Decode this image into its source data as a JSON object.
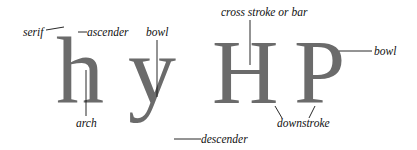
{
  "diagram": {
    "letters": [
      {
        "char": "h",
        "name": "h"
      },
      {
        "char": "y",
        "name": "y"
      },
      {
        "char": "H",
        "name": "H"
      },
      {
        "char": "P",
        "name": "P"
      }
    ],
    "labels": {
      "serif": "serif",
      "ascender": "ascender",
      "arch": "arch",
      "bowl_y": "bowl",
      "descender": "descender",
      "cross_stroke": "cross stroke or bar",
      "downstroke": "downstroke",
      "bowl_p": "bowl"
    },
    "colors": {
      "letter": "#6b6b6b",
      "label": "#111111",
      "background": "#ffffff"
    }
  }
}
